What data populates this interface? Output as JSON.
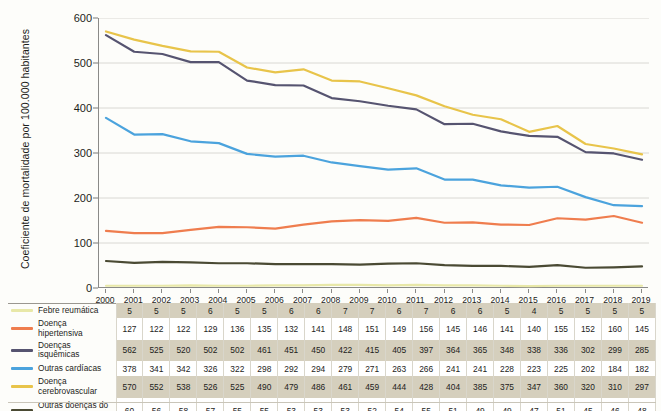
{
  "chart_data": {
    "type": "line",
    "title": "",
    "xlabel": "",
    "ylabel": "Coeficiente de mortalidade por 100.000 habitantes",
    "ylim": [
      0,
      600
    ],
    "yticks": [
      0,
      100,
      200,
      300,
      400,
      500,
      600
    ],
    "grid": true,
    "legend_position": "table-left",
    "categories": [
      "2000",
      "2001",
      "2002",
      "2003",
      "2004",
      "2005",
      "2006",
      "2007",
      "2008",
      "2009",
      "2010",
      "2011",
      "2012",
      "2013",
      "2014",
      "2015",
      "2016",
      "2017",
      "2018",
      "2019"
    ],
    "series": [
      {
        "name": "Febre reumática",
        "color": "#e8e8a8",
        "values": [
          5,
          5,
          5,
          6,
          5,
          5,
          6,
          6,
          7,
          7,
          6,
          7,
          6,
          6,
          5,
          4,
          5,
          5,
          5,
          5
        ]
      },
      {
        "name": "Doença hipertensiva",
        "color": "#ef7d4e",
        "values": [
          127,
          122,
          122,
          129,
          136,
          135,
          132,
          141,
          148,
          151,
          149,
          156,
          145,
          146,
          141,
          140,
          155,
          152,
          160,
          145
        ]
      },
      {
        "name": "Doenças isquêmicas",
        "color": "#565470",
        "values": [
          562,
          525,
          520,
          502,
          502,
          461,
          451,
          450,
          422,
          415,
          405,
          397,
          364,
          365,
          348,
          338,
          336,
          302,
          299,
          285
        ]
      },
      {
        "name": "Outras cardíacas",
        "color": "#4ba3dd",
        "values": [
          378,
          341,
          342,
          326,
          322,
          298,
          292,
          294,
          279,
          271,
          263,
          266,
          241,
          241,
          228,
          223,
          225,
          202,
          184,
          182
        ]
      },
      {
        "name": "Doença cerebrovascular",
        "color": "#e8c44a",
        "values": [
          570,
          552,
          538,
          526,
          525,
          490,
          479,
          486,
          461,
          459,
          444,
          428,
          404,
          385,
          375,
          347,
          360,
          320,
          310,
          297
        ]
      },
      {
        "name": "Outras doenças do aparelho circulatório",
        "color": "#4a4a33",
        "values": [
          60,
          56,
          58,
          57,
          55,
          55,
          53,
          53,
          53,
          52,
          54,
          55,
          51,
          49,
          49,
          47,
          51,
          45,
          46,
          48
        ]
      }
    ]
  },
  "table": {
    "row_labels": [
      "Febre reumática",
      "Doença hipertensiva",
      "Doenças isquêmicas",
      "Outras cardíacas",
      "Doença cerebrovascular",
      "Outras doenças do aparelho circulatório"
    ]
  },
  "colors": {
    "febre_reumatica": "#e8e8a8",
    "hipertensiva": "#ef7d4e",
    "isquemicas": "#565470",
    "outras_cardiacas": "#4ba3dd",
    "cerebrovascular": "#e8c44a",
    "outras_circulatorio": "#4a4a33",
    "table_band": "#d5cfbd",
    "page_background": "#fdfdfa"
  }
}
